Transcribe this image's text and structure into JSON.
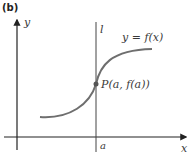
{
  "panel_label": "(b)",
  "axes": {
    "x_label": "x",
    "y_label": "y"
  },
  "tangent_line": {
    "label": "l"
  },
  "curve": {
    "label": "y = f(x)",
    "color": "#6e6e6e"
  },
  "point": {
    "label": "P(a, f(a))"
  },
  "x_tick": {
    "label": "a"
  }
}
